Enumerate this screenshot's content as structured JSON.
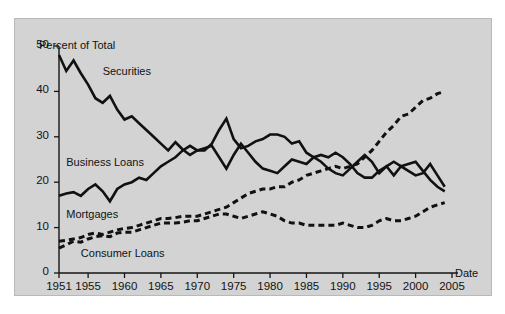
{
  "chart_data": {
    "type": "line",
    "title": "",
    "xlabel": "Date",
    "ylabel": "Percent of Total",
    "xlim": [
      1951,
      2005
    ],
    "ylim": [
      0,
      50
    ],
    "grid": false,
    "legend_position": "inline-annotations",
    "ytick_labels": [
      "0",
      "10",
      "20",
      "30",
      "40",
      "50"
    ],
    "ytick_values": [
      0,
      10,
      20,
      30,
      40,
      50
    ],
    "xtick_labels": [
      "1951",
      "1955",
      "1960",
      "1965",
      "1970",
      "1975",
      "1980",
      "1985",
      "1990",
      "1995",
      "2000",
      "2005"
    ],
    "xtick_values": [
      1951,
      1955,
      1960,
      1965,
      1970,
      1975,
      1980,
      1985,
      1990,
      1995,
      2000,
      2005
    ],
    "series": [
      {
        "name": "Securities",
        "style": "solid",
        "color": "#111111",
        "label_x": 1957.0,
        "label_y": 44.0,
        "x": [
          1951,
          1952,
          1953,
          1954,
          1955,
          1956,
          1957,
          1958,
          1959,
          1960,
          1961,
          1962,
          1963,
          1964,
          1965,
          1966,
          1967,
          1968,
          1969,
          1970,
          1971,
          1972,
          1973,
          1974,
          1975,
          1976,
          1977,
          1978,
          1979,
          1980,
          1981,
          1982,
          1983,
          1984,
          1985,
          1986,
          1987,
          1988,
          1989,
          1990,
          1991,
          1992,
          1993,
          1994,
          1995,
          1996,
          1997,
          1998,
          1999,
          2000,
          2001,
          2002,
          2003,
          2004
        ],
        "values": [
          48.0,
          44.5,
          46.8,
          44.0,
          41.5,
          38.5,
          37.5,
          39.0,
          36.0,
          33.8,
          34.5,
          33.0,
          31.5,
          30.0,
          28.5,
          27.0,
          28.8,
          27.2,
          26.0,
          27.0,
          27.5,
          28.0,
          25.5,
          23.0,
          26.0,
          28.5,
          26.5,
          24.5,
          23.0,
          22.5,
          22.0,
          23.5,
          25.0,
          24.5,
          24.0,
          25.5,
          24.5,
          23.0,
          22.0,
          21.5,
          23.0,
          24.5,
          26.0,
          24.5,
          22.0,
          23.5,
          21.5,
          23.5,
          22.5,
          21.5,
          22.0,
          24.0,
          21.5,
          19.0
        ]
      },
      {
        "name": "Business Loans",
        "style": "solid",
        "color": "#111111",
        "label_x": 1952.0,
        "label_y": 24.0,
        "x": [
          1951,
          1952,
          1953,
          1954,
          1955,
          1956,
          1957,
          1958,
          1959,
          1960,
          1961,
          1962,
          1963,
          1964,
          1965,
          1966,
          1967,
          1968,
          1969,
          1970,
          1971,
          1972,
          1973,
          1974,
          1975,
          1976,
          1977,
          1978,
          1979,
          1980,
          1981,
          1982,
          1983,
          1984,
          1985,
          1986,
          1987,
          1988,
          1989,
          1990,
          1991,
          1992,
          1993,
          1994,
          1995,
          1996,
          1997,
          1998,
          1999,
          2000,
          2001,
          2002,
          2003,
          2004
        ],
        "values": [
          17.0,
          17.5,
          17.8,
          17.0,
          18.5,
          19.5,
          18.0,
          15.8,
          18.5,
          19.5,
          20.0,
          21.0,
          20.5,
          22.0,
          23.5,
          24.5,
          25.5,
          27.0,
          28.0,
          27.0,
          27.0,
          28.5,
          31.5,
          34.0,
          29.5,
          27.5,
          28.0,
          29.0,
          29.5,
          30.5,
          30.5,
          30.0,
          28.5,
          29.0,
          26.5,
          25.5,
          26.0,
          25.5,
          26.5,
          25.5,
          24.0,
          22.0,
          21.0,
          21.0,
          22.5,
          23.5,
          24.5,
          23.5,
          24.0,
          24.5,
          22.5,
          20.5,
          19.0,
          18.0
        ]
      },
      {
        "name": "Mortgages",
        "style": "dashed",
        "color": "#111111",
        "label_x": 1952.0,
        "label_y": 12.5,
        "x": [
          1951,
          1952,
          1953,
          1954,
          1955,
          1956,
          1957,
          1958,
          1959,
          1960,
          1961,
          1962,
          1963,
          1964,
          1965,
          1966,
          1967,
          1968,
          1969,
          1970,
          1971,
          1972,
          1973,
          1974,
          1975,
          1976,
          1977,
          1978,
          1979,
          1980,
          1981,
          1982,
          1983,
          1984,
          1985,
          1986,
          1987,
          1988,
          1989,
          1990,
          1991,
          1992,
          1993,
          1994,
          1995,
          1996,
          1997,
          1998,
          1999,
          2000,
          2001,
          2002,
          2003,
          2004
        ],
        "values": [
          7.0,
          7.2,
          7.5,
          7.8,
          8.5,
          8.8,
          8.5,
          9.0,
          9.5,
          9.8,
          10.0,
          10.5,
          11.0,
          11.5,
          12.0,
          12.0,
          12.2,
          12.5,
          12.5,
          12.5,
          13.0,
          13.5,
          14.0,
          14.5,
          15.5,
          16.5,
          17.5,
          18.0,
          18.5,
          18.5,
          19.0,
          19.0,
          20.0,
          20.5,
          21.5,
          22.0,
          22.5,
          23.0,
          23.5,
          23.0,
          23.5,
          24.0,
          25.5,
          27.0,
          29.0,
          31.0,
          32.5,
          34.5,
          35.0,
          36.5,
          38.0,
          38.5,
          39.5,
          40.0
        ]
      },
      {
        "name": "Consumer Loans",
        "style": "dashed",
        "color": "#111111",
        "label_x": 1954.0,
        "label_y": 4.0,
        "x": [
          1951,
          1952,
          1953,
          1954,
          1955,
          1956,
          1957,
          1958,
          1959,
          1960,
          1961,
          1962,
          1963,
          1964,
          1965,
          1966,
          1967,
          1968,
          1969,
          1970,
          1971,
          1972,
          1973,
          1974,
          1975,
          1976,
          1977,
          1978,
          1979,
          1980,
          1981,
          1982,
          1983,
          1984,
          1985,
          1986,
          1987,
          1988,
          1989,
          1990,
          1991,
          1992,
          1993,
          1994,
          1995,
          1996,
          1997,
          1998,
          1999,
          2000,
          2001,
          2002,
          2003,
          2004
        ],
        "values": [
          5.5,
          6.2,
          7.0,
          6.8,
          7.5,
          8.0,
          8.2,
          8.0,
          8.8,
          9.0,
          9.0,
          9.5,
          10.0,
          10.5,
          11.0,
          11.0,
          11.0,
          11.2,
          11.5,
          11.5,
          12.0,
          12.5,
          13.0,
          13.0,
          12.5,
          12.0,
          12.5,
          13.0,
          13.5,
          13.0,
          12.5,
          11.5,
          11.0,
          11.0,
          10.5,
          10.5,
          10.5,
          10.5,
          10.5,
          11.0,
          10.5,
          10.0,
          10.0,
          10.5,
          11.5,
          12.0,
          11.5,
          11.5,
          12.0,
          12.5,
          13.5,
          14.5,
          15.0,
          15.5
        ]
      }
    ]
  },
  "axis": {
    "y_title": "Percent of Total",
    "x_title": "Date"
  }
}
